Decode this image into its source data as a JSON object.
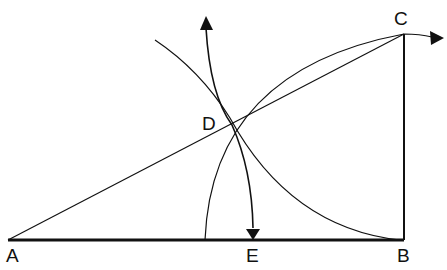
{
  "diagram": {
    "points": [
      {
        "id": "A",
        "label": "A",
        "x": 8,
        "y": 240
      },
      {
        "id": "B",
        "label": "B",
        "x": 404,
        "y": 240
      },
      {
        "id": "C",
        "label": "C",
        "x": 404,
        "y": 34
      },
      {
        "id": "D",
        "label": "D",
        "x": 229,
        "y": 113
      },
      {
        "id": "E",
        "label": "E",
        "x": 253,
        "y": 240
      }
    ],
    "segments": [
      {
        "from": "A",
        "to": "B",
        "weight": "bold"
      },
      {
        "from": "B",
        "to": "C",
        "weight": "medium"
      },
      {
        "from": "A",
        "to": "C",
        "weight": "thin"
      }
    ],
    "arcs": [
      {
        "name": "arc-centered-B-through-C",
        "center": "B",
        "arrow": "right"
      },
      {
        "name": "arc-centered-C-through-B",
        "center": "C",
        "arrow": "none"
      },
      {
        "name": "arc-centered-A-through-D-to-E",
        "center": "A",
        "arrow": "both"
      }
    ],
    "colors": {
      "stroke": "#111111",
      "background": "#ffffff"
    }
  }
}
